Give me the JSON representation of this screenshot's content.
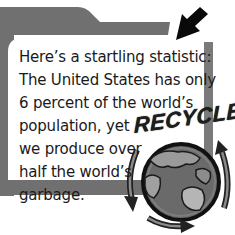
{
  "callout": {
    "lines": [
      "Here’s a startling statistic:",
      "The United States has only",
      "6 percent of the world’s",
      "population, yet",
      "we produce over",
      "half the world’s",
      "garbage."
    ]
  },
  "badge": {
    "label": "RECYCLE!"
  },
  "icons": {
    "arrow": "arrow-down-left-icon",
    "globe": "globe-icon",
    "cycle_arrows": "recycle-arrows-icon"
  },
  "colors": {
    "folder_gray": "#6f6f6f",
    "card_white": "#ffffff",
    "text": "#1a1a1a",
    "arrow_black": "#0a0a0a",
    "globe_gray": "#6a6a6a"
  }
}
